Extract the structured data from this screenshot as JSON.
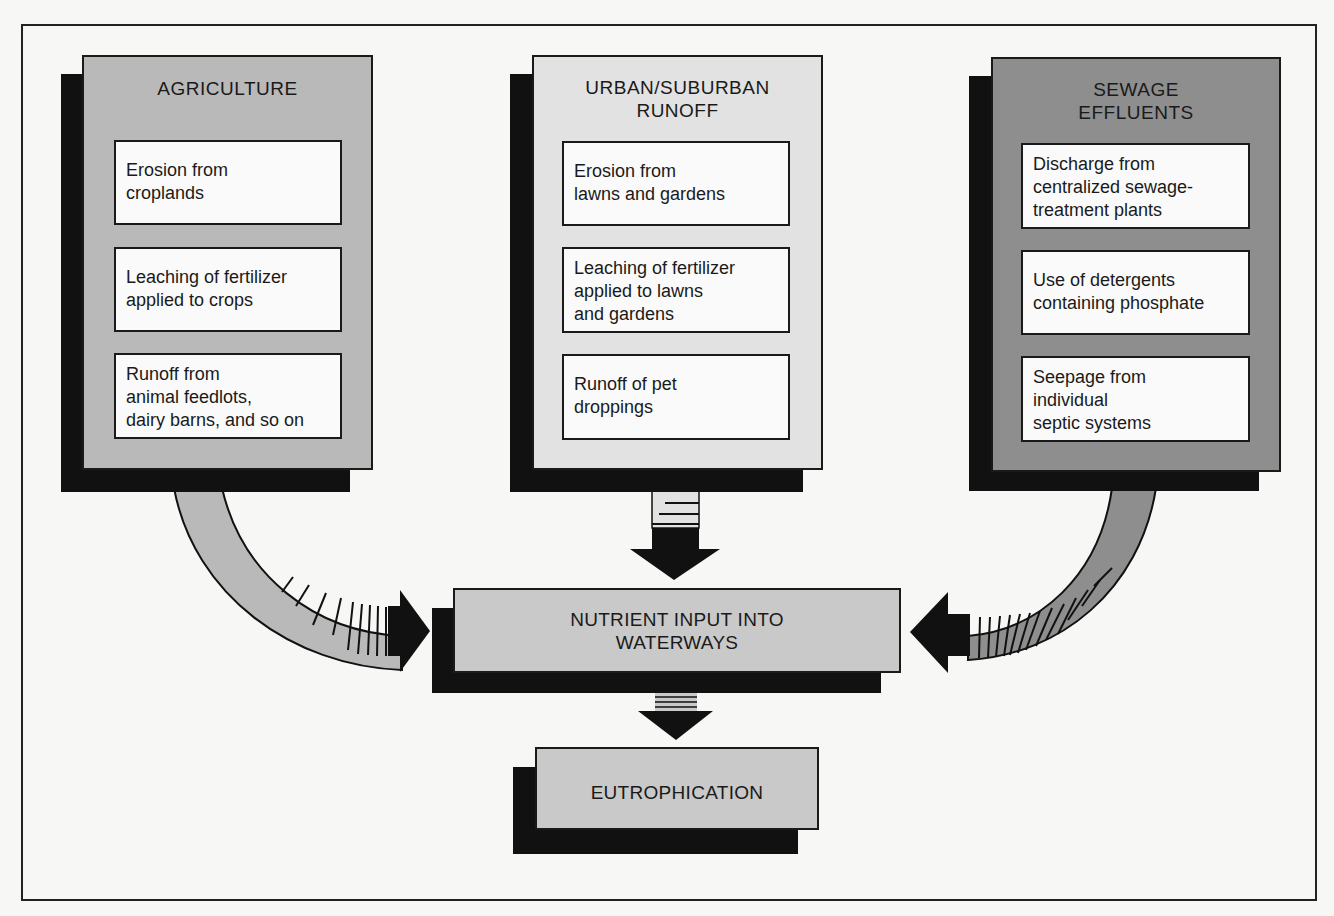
{
  "diagram": {
    "colors": {
      "agriculture_fill": "#b9b9b9",
      "urban_fill": "#e2e2e2",
      "sewage_fill": "#8e8e8e",
      "outcome_fill": "#c9c9c9",
      "item_fill": "#fafafa",
      "shadow": "#111111"
    },
    "sources": [
      {
        "title": "AGRICULTURE",
        "items": [
          "Erosion from\ncroplands",
          "Leaching of fertilizer\napplied to crops",
          "Runoff from\nanimal feedlots,\ndairy barns, and so on"
        ]
      },
      {
        "title": "URBAN/SUBURBAN\nRUNOFF",
        "items": [
          "Erosion from\nlawns and gardens",
          "Leaching of fertilizer\napplied to lawns\nand gardens",
          "Runoff of pet\ndroppings"
        ]
      },
      {
        "title": "SEWAGE\nEFFLUENTS",
        "items": [
          "Discharge from\ncentralized sewage-\ntreatment plants",
          "Use of detergents\ncontaining phosphate",
          "Seepage from\nindividual\nseptic systems"
        ]
      }
    ],
    "nutrient_box": {
      "label": "NUTRIENT INPUT INTO\nWATERWAYS"
    },
    "outcome_box": {
      "label": "EUTROPHICATION"
    },
    "edges": [
      {
        "from": "AGRICULTURE",
        "to": "NUTRIENT INPUT INTO WATERWAYS",
        "style": "curved-arrow"
      },
      {
        "from": "URBAN/SUBURBAN RUNOFF",
        "to": "NUTRIENT INPUT INTO WATERWAYS",
        "style": "straight-arrow"
      },
      {
        "from": "SEWAGE EFFLUENTS",
        "to": "NUTRIENT INPUT INTO WATERWAYS",
        "style": "curved-arrow"
      },
      {
        "from": "NUTRIENT INPUT INTO WATERWAYS",
        "to": "EUTROPHICATION",
        "style": "straight-arrow"
      }
    ]
  }
}
